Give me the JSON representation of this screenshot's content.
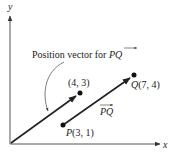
{
  "diagram": {
    "axes": {
      "x_label": "x",
      "y_label": "y"
    },
    "annotation": {
      "text": "Position vector for ",
      "vector_name": "PQ"
    },
    "points": [
      {
        "name": "origin",
        "label": ""
      },
      {
        "name": "position-tip",
        "label": "(4, 3)"
      },
      {
        "name": "P",
        "letter": "P",
        "label": "(3, 1)"
      },
      {
        "name": "Q",
        "letter": "Q",
        "label": "(7, 4)"
      }
    ],
    "vector_label": "PQ",
    "colors": {
      "ink": "#222222",
      "axis": "#555555",
      "background": "#ffffff"
    }
  }
}
